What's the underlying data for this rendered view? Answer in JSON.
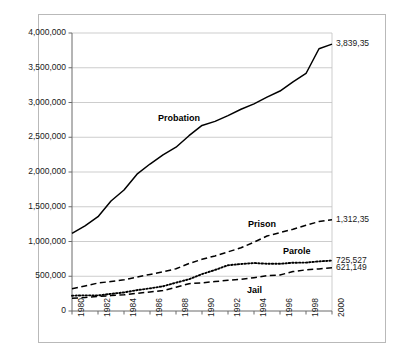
{
  "chart_data": {
    "type": "line",
    "title": "",
    "subtitle": "",
    "xlabel": "",
    "ylabel": "",
    "grid": true,
    "legend_position": "inline-labels",
    "x": [
      1980,
      1981,
      1982,
      1983,
      1984,
      1985,
      1986,
      1987,
      1988,
      1989,
      1990,
      1991,
      1992,
      1993,
      1994,
      1995,
      1996,
      1997,
      1998,
      1999,
      2000
    ],
    "xlim": [
      1980,
      2000
    ],
    "ylim": [
      0,
      4000000
    ],
    "ytick_values": [
      0,
      500000,
      1000000,
      1500000,
      2000000,
      2500000,
      3000000,
      3500000,
      4000000
    ],
    "ytick_labels": [
      "0",
      "500,000",
      "1,000,000",
      "1,500,000",
      "2,000,000",
      "2,500,000",
      "3,000,000",
      "3,500,000",
      "4,000,000"
    ],
    "xtick_values": [
      1980,
      1982,
      1984,
      1986,
      1988,
      1990,
      1992,
      1994,
      1996,
      1998,
      2000
    ],
    "xtick_labels": [
      "1980",
      "1982",
      "1984",
      "1986",
      "1988",
      "1990",
      "1992",
      "1994",
      "1996",
      "1998",
      "2000"
    ],
    "series": [
      {
        "name": "Probation",
        "style": "solid",
        "color": "#000000",
        "values": [
          1118097,
          1225934,
          1357264,
          1582947,
          1740948,
          1968712,
          2114621,
          2247158,
          2356483,
          2522125,
          2670234,
          2728472,
          2811611,
          2903061,
          2981022,
          3077861,
          3164996,
          3296513,
          3417613,
          3773624,
          3839532
        ]
      },
      {
        "name": "Prison",
        "style": "dashed",
        "color": "#000000",
        "values": [
          319598,
          360029,
          402914,
          423898,
          448264,
          487593,
          526436,
          562814,
          607766,
          683367,
          743382,
          792535,
          850566,
          909381,
          990147,
          1078542,
          1127528,
          1176564,
          1232900,
          1287172,
          1312354
        ]
      },
      {
        "name": "Parole",
        "style": "dotted",
        "color": "#000000",
        "values": [
          220438,
          225539,
          224604,
          246440,
          266992,
          300203,
          325638,
          355505,
          407977,
          456803,
          531407,
          590442,
          658601,
          676100,
          690371,
          679421,
          679733,
          694787,
          696385,
          714457,
          725527
        ]
      },
      {
        "name": "Jail",
        "style": "dashed",
        "color": "#000000",
        "values": [
          182288,
          195085,
          207853,
          221815,
          233018,
          254986,
          272736,
          294092,
          341893,
          393303,
          405320,
          424129,
          441781,
          455500,
          479800,
          507044,
          518492,
          567079,
          592462,
          605943,
          621149
        ]
      }
    ],
    "series_inline_labels": [
      {
        "name": "Probation",
        "x_px": 158,
        "y_px": 113
      },
      {
        "name": "Prison",
        "x_px": 248,
        "y_px": 219
      },
      {
        "name": "Parole",
        "x_px": 283,
        "y_px": 246
      },
      {
        "name": "Jail",
        "x_px": 247,
        "y_px": 285
      }
    ],
    "end_labels": [
      {
        "series": "Probation",
        "text": "3,839,35"
      },
      {
        "series": "Prison",
        "text": "1,312,35"
      },
      {
        "series": "Parole",
        "text": "725,527"
      },
      {
        "series": "Jail",
        "text": "621,149"
      }
    ],
    "colors": {
      "axis": "#000000",
      "gridline": "#c0c0c0",
      "frame": "#b9b9b9",
      "background": "#ffffff",
      "text": "#1a1a1a"
    }
  }
}
